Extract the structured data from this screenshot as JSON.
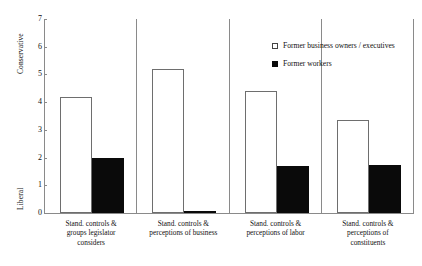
{
  "chart_data": {
    "type": "bar",
    "title": "",
    "xlabel": "",
    "ylabel": "",
    "ylim": [
      0,
      7
    ],
    "yticks": [
      0,
      1,
      2,
      3,
      4,
      5,
      6,
      7
    ],
    "grid": false,
    "legend_position": "upper-right",
    "y_axis_top_label": "Conservative",
    "y_axis_bottom_label": "Liberal",
    "categories": [
      "Stand. controls & groups legislator considers",
      "Stand. controls & perceptions of business",
      "Stand. controls & perceptions of labor",
      "Stand. controls & perceptions of constituents"
    ],
    "category_lines": [
      [
        "Stand. controls &",
        "groups legislator",
        "considers"
      ],
      [
        "Stand. controls &",
        "perceptions of business"
      ],
      [
        "Stand. controls &",
        "perceptions of labor"
      ],
      [
        "Stand. controls &",
        "perceptions of",
        "constituents"
      ]
    ],
    "series": [
      {
        "name": "Former business owners / executives",
        "style": "open",
        "color": "#ffffff",
        "edge_color": "#6e6e6e",
        "values": [
          4.2,
          5.2,
          4.4,
          3.35
        ]
      },
      {
        "name": "Former workers",
        "style": "filled",
        "color": "#0a0a0a",
        "edge_color": "#0a0a0a",
        "values": [
          2.0,
          0.07,
          1.7,
          1.75
        ]
      }
    ]
  },
  "legend": {
    "items": [
      {
        "label": "Former business owners / executives",
        "marker": "open-square"
      },
      {
        "label": "Former workers",
        "marker": "filled-square"
      }
    ]
  },
  "axis": {
    "y_top_title": "Conservative",
    "y_bottom_title": "Liberal",
    "y_tick_labels": [
      "7",
      "6",
      "5",
      "4",
      "3",
      "2",
      "1",
      "0"
    ]
  }
}
